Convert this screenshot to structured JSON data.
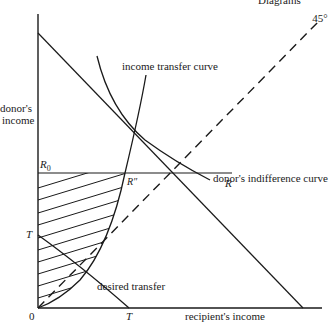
{
  "header_fragment": "Diagrams",
  "axes": {
    "y_label_line1": "donor's",
    "y_label_line2": "income",
    "x_label": "recipient's income",
    "origin": "0"
  },
  "angle_label": "45°",
  "curves": {
    "income_transfer": "income transfer curve",
    "indifference": "donor's indifference curve",
    "desired_transfer": "desired transfer"
  },
  "points": {
    "r0_base": "R",
    "r0_sub": "0",
    "r_double": "R″",
    "r": "R",
    "t_y": "T",
    "t_x": "T"
  },
  "colors": {
    "ink": "#1a1a1a",
    "background": "#ffffff"
  }
}
